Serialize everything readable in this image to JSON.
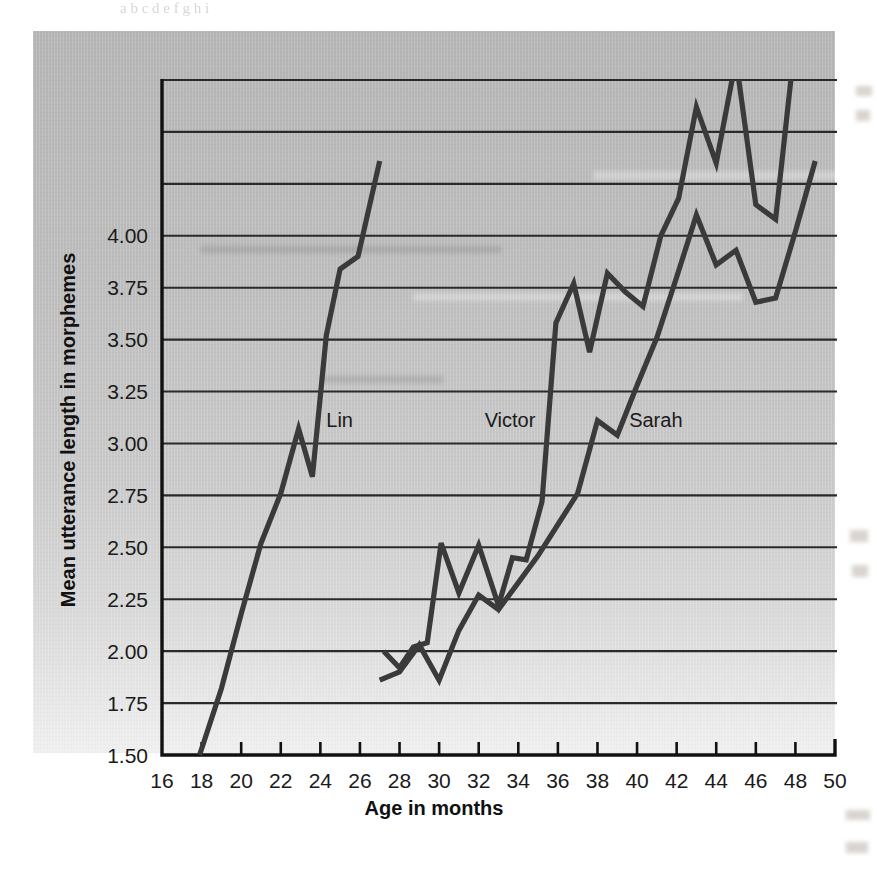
{
  "page": {
    "top_text_remnant": "a b  c  d      e        f g           h              i"
  },
  "chart_data": {
    "type": "line",
    "title": "",
    "xlabel": "Age in months",
    "ylabel": "Mean utterance length in morphemes",
    "xlim": [
      16,
      50
    ],
    "ylim": [
      1.5,
      4.75
    ],
    "xticks": [
      16,
      18,
      20,
      22,
      24,
      26,
      28,
      30,
      32,
      34,
      36,
      38,
      40,
      42,
      44,
      46,
      48,
      50
    ],
    "yticks": [
      1.5,
      1.75,
      2.0,
      2.25,
      2.5,
      2.75,
      3.0,
      3.25,
      3.5,
      3.75,
      4.0
    ],
    "ytick_labels": [
      "1.50",
      "1.75",
      "2.00",
      "2.25",
      "2.50",
      "2.75",
      "3.00",
      "3.25",
      "3.50",
      "3.75",
      "4.00"
    ],
    "xtick_labels": [
      "16",
      "18",
      "20",
      "22",
      "24",
      "26",
      "28",
      "30",
      "32",
      "34",
      "36",
      "38",
      "40",
      "42",
      "44",
      "46",
      "48",
      "50"
    ],
    "grid": "horizontal",
    "legend": "inline-labels",
    "line_color": "#3a3a3a",
    "series": [
      {
        "name": "Lin",
        "label_x": 24.3,
        "label_y": 3.08,
        "x": [
          17.9,
          19.0,
          20.0,
          21.0,
          22.0,
          22.9,
          23.6,
          24.3,
          25.0,
          25.9,
          27.0
        ],
        "y": [
          1.5,
          1.82,
          2.18,
          2.52,
          2.76,
          3.07,
          2.84,
          3.52,
          3.84,
          3.9,
          4.36
        ]
      },
      {
        "name": "Victor",
        "label_x": 32.3,
        "label_y": 3.08,
        "x": [
          27.2,
          28.0,
          28.7,
          29.4,
          30.1,
          31.0,
          32.0,
          33.0,
          33.7,
          34.4,
          35.2,
          35.9,
          36.8,
          37.6,
          38.5,
          39.4,
          40.3,
          41.2,
          42.1,
          43.0,
          44.0,
          45.0,
          46.0,
          47.0,
          48.0
        ],
        "y": [
          2.0,
          1.92,
          2.02,
          2.04,
          2.52,
          2.28,
          2.51,
          2.22,
          2.45,
          2.44,
          2.72,
          3.58,
          3.77,
          3.44,
          3.82,
          3.73,
          3.66,
          4.0,
          4.18,
          4.62,
          4.35,
          4.85,
          4.15,
          4.08,
          4.95
        ]
      },
      {
        "name": "Sarah",
        "label_x": 39.6,
        "label_y": 3.08,
        "x": [
          27.0,
          28.0,
          29.0,
          30.0,
          31.0,
          32.0,
          33.0,
          34.0,
          35.0,
          36.0,
          37.0,
          38.0,
          39.0,
          40.0,
          41.0,
          42.0,
          43.0,
          44.0,
          45.0,
          46.0,
          47.0,
          48.0,
          49.0
        ],
        "y": [
          1.86,
          1.9,
          2.03,
          1.86,
          2.1,
          2.27,
          2.2,
          2.33,
          2.46,
          2.61,
          2.76,
          3.11,
          3.04,
          3.28,
          3.51,
          3.8,
          4.1,
          3.86,
          3.93,
          3.68,
          3.7,
          4.02,
          4.36
        ]
      }
    ]
  }
}
